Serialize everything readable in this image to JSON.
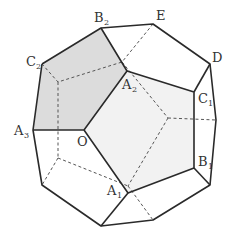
{
  "figure": {
    "colors": {
      "edge": "#2a2a2a",
      "hidden_edge": "#555555",
      "shaded_face": "#dcdcdc",
      "light_face": "#f2f2f2",
      "background": "#ffffff"
    },
    "labels": {
      "B2": {
        "main": "B",
        "sub": "2"
      },
      "E": {
        "main": "E",
        "sub": ""
      },
      "C2": {
        "main": "C",
        "sub": "2"
      },
      "D": {
        "main": "D",
        "sub": ""
      },
      "A2": {
        "main": "A",
        "sub": "2"
      },
      "C1": {
        "main": "C",
        "sub": "1"
      },
      "A3": {
        "main": "A",
        "sub": "3"
      },
      "O": {
        "main": "O",
        "sub": ""
      },
      "B1": {
        "main": "B",
        "sub": "1"
      },
      "A1": {
        "main": "A",
        "sub": "1"
      }
    }
  }
}
